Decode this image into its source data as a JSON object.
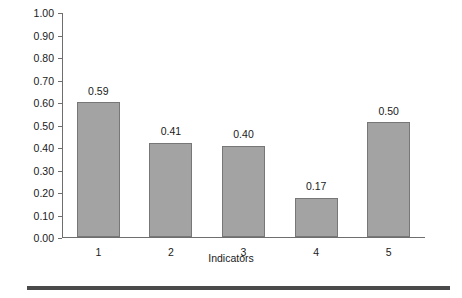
{
  "chart_data": {
    "type": "bar",
    "title": "",
    "xlabel": "Indicators",
    "ylabel": "",
    "categories": [
      "1",
      "2",
      "3",
      "4",
      "5"
    ],
    "values": [
      0.59,
      0.41,
      0.4,
      0.17,
      0.5
    ],
    "value_labels": [
      "0.59",
      "0.41",
      "0.40",
      "0.17",
      "0.50"
    ],
    "bar_heights": [
      0.6,
      0.42,
      0.405,
      0.175,
      0.51
    ],
    "ylim": [
      0.0,
      1.0
    ],
    "ytick_values": [
      1.0,
      0.9,
      0.8,
      0.7,
      0.6,
      0.5,
      0.4,
      0.3,
      0.2,
      0.1,
      0.0
    ],
    "ytick_labels": [
      "1.00",
      "0.90",
      "0.80",
      "0.70",
      "0.60",
      "0.50",
      "0.40",
      "0.30",
      "0.20",
      "0.10",
      "0.00"
    ],
    "grid": false,
    "legend": false,
    "legend_position": "none",
    "bar_color": "#a3a3a3",
    "bar_edge_color": "#777777",
    "axis_color": "#6e6e6e",
    "background_color": "#ffffff",
    "rule_color": "#4a4a4a"
  }
}
